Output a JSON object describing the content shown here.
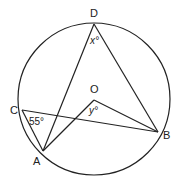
{
  "figure": {
    "type": "circle-geometry",
    "stroke_color": "#222222",
    "background": "#ffffff",
    "circle": {
      "center_label": "O"
    },
    "points": {
      "D": "D",
      "O": "O",
      "C": "C",
      "A": "A",
      "B": "B"
    },
    "segments": [
      "AD",
      "DB",
      "CB",
      "CA",
      "AO",
      "OB"
    ],
    "angles": {
      "angle_CAB_or_C": {
        "vertex": "C",
        "label": "55°"
      },
      "angle_D": {
        "vertex": "D",
        "label": "x°"
      },
      "angle_O": {
        "vertex": "O",
        "label": "y°"
      }
    }
  }
}
